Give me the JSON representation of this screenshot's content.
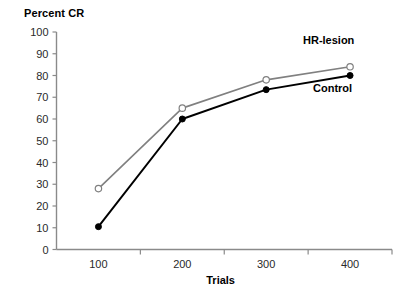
{
  "chart_data": {
    "type": "line",
    "title": "Percent CR",
    "xlabel": "Trials",
    "ylabel": "Percent CR",
    "categories": [
      "100",
      "200",
      "300",
      "400"
    ],
    "x": [
      100,
      200,
      300,
      400
    ],
    "series": [
      {
        "name": "HR-lesion",
        "values": [
          28,
          65,
          78,
          84
        ],
        "color": "#808080",
        "marker": "open-circle"
      },
      {
        "name": "Control",
        "values": [
          10.5,
          60,
          73.5,
          80
        ],
        "color": "#000000",
        "marker": "filled-circle"
      }
    ],
    "ylim": [
      0,
      100
    ],
    "ytick_labels": [
      "0",
      "10",
      "20",
      "30",
      "40",
      "50",
      "60",
      "70",
      "80",
      "90",
      "100"
    ],
    "yticks": [
      0,
      10,
      20,
      30,
      40,
      50,
      60,
      70,
      80,
      90,
      100
    ],
    "xtick_labels": [
      "100",
      "200",
      "300",
      "400"
    ],
    "grid": false,
    "legend": "inline-annotations",
    "annotations": [
      {
        "text": "HR-lesion",
        "series": "HR-lesion"
      },
      {
        "text": "Control",
        "series": "Control"
      }
    ]
  },
  "axis": {
    "line_color": "#8a8a8a"
  }
}
